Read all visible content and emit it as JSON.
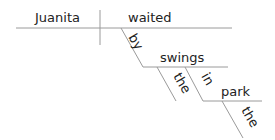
{
  "diagram": {
    "type": "reed-kellogg-sentence-diagram",
    "subject": "Juanita",
    "verb": "waited",
    "modifiers": [
      {
        "preposition": "by",
        "object": "swings",
        "article": "the"
      },
      {
        "preposition": "in",
        "object": "park",
        "article": "the"
      }
    ]
  },
  "words": {
    "subject": "Juanita",
    "verb": "waited",
    "prep1": "by",
    "obj1": "swings",
    "art1": "the",
    "prep2": "in",
    "obj2": "park",
    "art2": "the"
  }
}
